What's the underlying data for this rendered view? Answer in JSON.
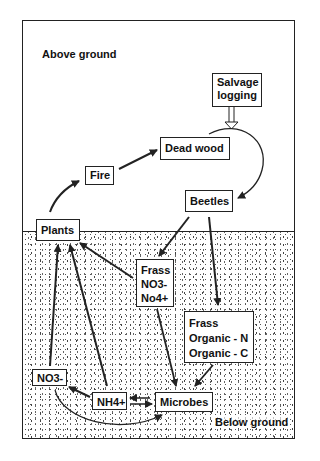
{
  "diagram": {
    "regions": {
      "above": "Above ground",
      "below": "Below ground"
    },
    "nodes": {
      "salvage": {
        "lines": [
          "Salvage",
          "logging"
        ]
      },
      "dead_wood": {
        "label": "Dead wood"
      },
      "fire": {
        "label": "Fire"
      },
      "beetles": {
        "label": "Beetles"
      },
      "plants": {
        "label": "Plants"
      },
      "frass_mineral": {
        "lines": [
          "Frass",
          "NO3-",
          "No4+"
        ]
      },
      "frass_organic": {
        "lines": [
          "Frass",
          "Organic - N",
          "Organic - C"
        ]
      },
      "no3": {
        "label": "NO3-"
      },
      "nh4": {
        "label": "NH4+"
      },
      "microbes": {
        "label": "Microbes"
      }
    },
    "edges": [
      {
        "from": "Salvage logging",
        "to": "Dead wood → Beetles pathway",
        "style": "hollow double-line arrow"
      },
      {
        "from": "Plants",
        "to": "Fire"
      },
      {
        "from": "Fire",
        "to": "Dead wood"
      },
      {
        "from": "Dead wood",
        "to": "Beetles",
        "style": "curved"
      },
      {
        "from": "Beetles",
        "to": "Frass NO3- No4+"
      },
      {
        "from": "Beetles",
        "to": "Frass Organic - N Organic - C"
      },
      {
        "from": "Frass NO3- No4+",
        "to": "Plants"
      },
      {
        "from": "Frass NO3- No4+",
        "to": "Microbes"
      },
      {
        "from": "Frass Organic - N Organic - C",
        "to": "Microbes"
      },
      {
        "from": "NO3-",
        "to": "Plants"
      },
      {
        "from": "NH4+",
        "to": "Plants"
      },
      {
        "from": "NH4+",
        "to": "NO3-"
      },
      {
        "from": "NH4+",
        "to": "Microbes",
        "style": "bidirectional"
      },
      {
        "from": "NO3-",
        "to": "Microbes",
        "style": "curved"
      }
    ],
    "colors": {
      "ink": "#222222",
      "background": "#ffffff",
      "stipple": "#555555"
    }
  }
}
